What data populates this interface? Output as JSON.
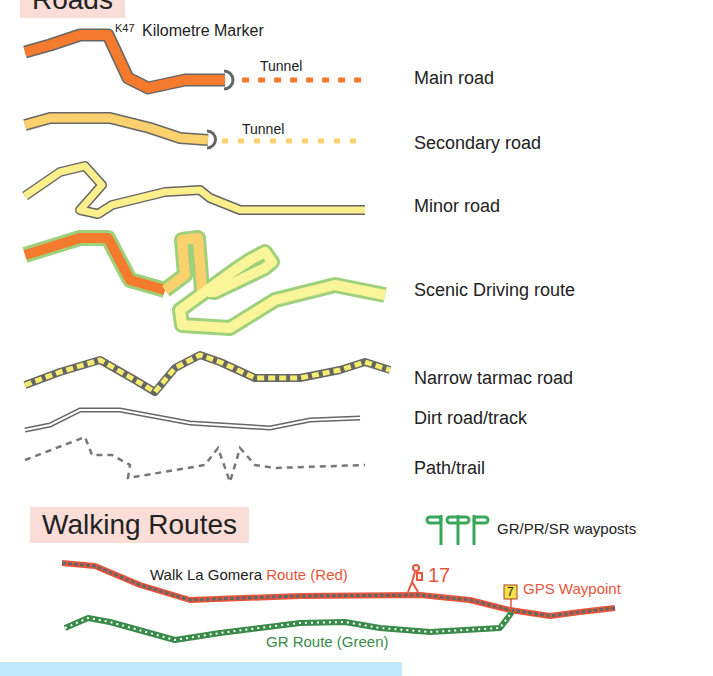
{
  "sections": {
    "roads": {
      "title": "Roads"
    },
    "walking": {
      "title": "Walking Routes"
    }
  },
  "roads": [
    {
      "label": "Main road",
      "color": "#f47a2e",
      "extra": {
        "marker_code": "K47",
        "marker_label": "Kilometre Marker",
        "tunnel_label": "Tunnel"
      }
    },
    {
      "label": "Secondary road",
      "color": "#fbd16d",
      "extra": {
        "tunnel_label": "Tunnel"
      }
    },
    {
      "label": "Minor road",
      "color": "#fbef8c"
    },
    {
      "label": "Scenic Driving route",
      "color": "#9fd07c"
    },
    {
      "label": "Narrow tarmac road",
      "color": "#f4ec6e"
    },
    {
      "label": "Dirt road/track",
      "color": "#777777"
    },
    {
      "label": "Path/trail",
      "color": "#777777"
    }
  ],
  "walking": {
    "waypost_label": "GR/PR/SR wayposts",
    "waypost_color": "#3aa65a",
    "red_route_prefix": "Walk La Gomera ",
    "red_route_label": "Route (Red)",
    "red_route_color": "#e8553a",
    "walk_number": "17",
    "gps_number": "7",
    "gps_label": "GPS Waypoint",
    "green_route_label": "GR Route (Green)",
    "green_route_color": "#3a8a4a"
  }
}
